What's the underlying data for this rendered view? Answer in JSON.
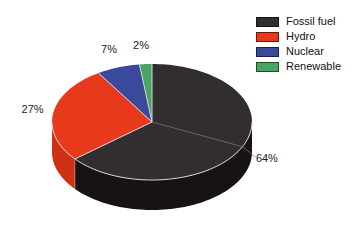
{
  "chart_data": {
    "type": "pie",
    "projection": "3d",
    "title": "",
    "unit": "%",
    "start_angle_deg": 90,
    "direction": "clockwise",
    "background": "#ffffff",
    "outline_color": "#d6d6d6",
    "label_color": "#1c1c1c",
    "legend_position": "top-right",
    "slices": [
      {
        "label": "Fossil fuel",
        "value": 64,
        "pct_label": "64%",
        "color": "#322d30",
        "side_color": "#161216",
        "leader": true
      },
      {
        "label": "Hydro",
        "value": 27,
        "pct_label": "27%",
        "color": "#e7391c",
        "side_color": "#cf3213",
        "leader": false
      },
      {
        "label": "Nuclear",
        "value": 7,
        "pct_label": "7%",
        "color": "#3a499c",
        "side_color": "#2d3a7e",
        "leader": false
      },
      {
        "label": "Renewable",
        "value": 2,
        "pct_label": "2%",
        "color": "#48a566",
        "side_color": "#388351",
        "leader": false
      }
    ]
  }
}
